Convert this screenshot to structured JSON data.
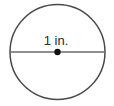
{
  "figure": {
    "name": "circle-with-diameter",
    "type": "geometry-diagram",
    "background_color": "#ffffff",
    "width": 114,
    "height": 106,
    "shape": {
      "kind": "circle",
      "center_x": 57.5,
      "center_y": 52,
      "radius": 47.5,
      "stroke_color": "#4a4a4a",
      "stroke_width": 1.5,
      "fill": "none"
    },
    "center_point": {
      "label": "center-dot",
      "x": 57.5,
      "y": 52,
      "radius": 3.2,
      "color": "#111111"
    },
    "diameter_segment": {
      "label": "diameter-line",
      "x1": 10,
      "y1": 52,
      "x2": 105,
      "y2": 52,
      "stroke_color": "#6b6b6b",
      "stroke_width": 1.6
    },
    "measurement_label": {
      "text": "1 in.",
      "value": "1",
      "unit": "in.",
      "x": 56,
      "y": 45,
      "font_size": 13,
      "color": "#2b2b2b"
    }
  }
}
